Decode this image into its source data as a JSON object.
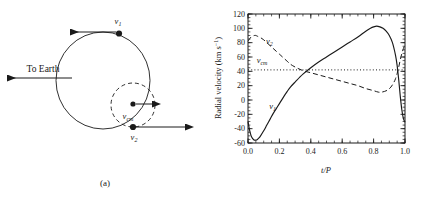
{
  "figure": {
    "panels": [
      {
        "id": "a",
        "caption": "(a)"
      },
      {
        "id": "b",
        "caption": "(b)"
      }
    ]
  },
  "panel_a": {
    "caption": "(a)",
    "to_earth_label": "To Earth",
    "labels": {
      "v1": "v",
      "v1_sub": "1",
      "v2": "v",
      "v2_sub": "2",
      "vcm": "v",
      "vcm_sub": "cm"
    },
    "description": "Orbit diagram: large solid ellipse (star 1 orbit), small dashed circle (star 2 orbit) around center of mass; velocity arrows at v1 (leftward), v2 (rightward), vcm (rightward); long arrow to Earth pointing left."
  },
  "chart_data": {
    "type": "line",
    "title": "",
    "xlabel": "t/P",
    "ylabel": "Radial velocity (km s−1)",
    "ylabel_parts": {
      "main": "Radial velocity (km s",
      "exp": "−1",
      "tail": ")"
    },
    "xlim": [
      0.0,
      1.0
    ],
    "ylim": [
      -60,
      120
    ],
    "xticks": [
      0.0,
      0.2,
      0.4,
      0.6,
      0.8,
      1.0
    ],
    "xtick_labels": [
      "0.0",
      "0.2",
      "0.4",
      "0.6",
      "0.8",
      "1.0"
    ],
    "yticks": [
      -60,
      -40,
      -20,
      0,
      20,
      40,
      60,
      80,
      100,
      120
    ],
    "ytick_labels": [
      "-60",
      "-40",
      "-20",
      "0",
      "20",
      "40",
      "60",
      "80",
      "100",
      "120"
    ],
    "x_minor_step": 0.05,
    "y_minor_step": 5,
    "grid": false,
    "legend": "inline-annotations",
    "annotations": [
      {
        "name": "v1",
        "text": "v",
        "sub": "1",
        "x": 0.135,
        "y": -12
      },
      {
        "name": "v2",
        "text": "v",
        "sub": "2",
        "x": 0.115,
        "y": 78
      },
      {
        "name": "vcm",
        "text": "v",
        "sub": "cm",
        "x": 0.055,
        "y": 51
      }
    ],
    "series": [
      {
        "name": "v1",
        "style": "solid",
        "label": "v1",
        "x": [
          0.0,
          0.01,
          0.02,
          0.03,
          0.04,
          0.05,
          0.06,
          0.07,
          0.08,
          0.1,
          0.12,
          0.14,
          0.16,
          0.18,
          0.2,
          0.22,
          0.25,
          0.27,
          0.3,
          0.35,
          0.4,
          0.45,
          0.5,
          0.55,
          0.6,
          0.65,
          0.7,
          0.75,
          0.78,
          0.8,
          0.82,
          0.84,
          0.86,
          0.88,
          0.9,
          0.92,
          0.94,
          0.95,
          0.96,
          0.97,
          0.98,
          0.99,
          1.0
        ],
        "y": [
          -30,
          -42,
          -50,
          -54,
          -56,
          -56,
          -55,
          -53,
          -50,
          -43,
          -35,
          -27,
          -19,
          -12,
          -5,
          2,
          12,
          18,
          25,
          36,
          45,
          53,
          60,
          67,
          74,
          81,
          88,
          96,
          100,
          102,
          103,
          102,
          100,
          96,
          90,
          80,
          62,
          48,
          28,
          5,
          -14,
          -26,
          -31
        ]
      },
      {
        "name": "v2",
        "style": "dashed",
        "label": "v2",
        "x": [
          0.0,
          0.02,
          0.04,
          0.05,
          0.06,
          0.08,
          0.1,
          0.12,
          0.14,
          0.16,
          0.18,
          0.2,
          0.22,
          0.25,
          0.27,
          0.3,
          0.35,
          0.4,
          0.45,
          0.5,
          0.55,
          0.6,
          0.65,
          0.7,
          0.75,
          0.8,
          0.83,
          0.85,
          0.87,
          0.89,
          0.91,
          0.93,
          0.94,
          0.95,
          0.96,
          0.97,
          0.98,
          0.99,
          1.0
        ],
        "y": [
          82,
          88,
          90,
          90,
          89,
          87,
          84,
          80,
          76,
          72,
          68,
          64,
          60,
          54,
          50,
          46,
          41,
          38,
          35,
          32,
          29,
          26,
          23,
          20,
          16,
          13,
          11,
          11,
          12,
          14,
          18,
          25,
          30,
          37,
          46,
          56,
          65,
          72,
          77
        ]
      },
      {
        "name": "vcm",
        "style": "dotted",
        "label": "vcm",
        "constant": 42,
        "x": [
          0.0,
          1.0
        ],
        "y": [
          42,
          42
        ]
      }
    ],
    "caption": "(b)"
  }
}
